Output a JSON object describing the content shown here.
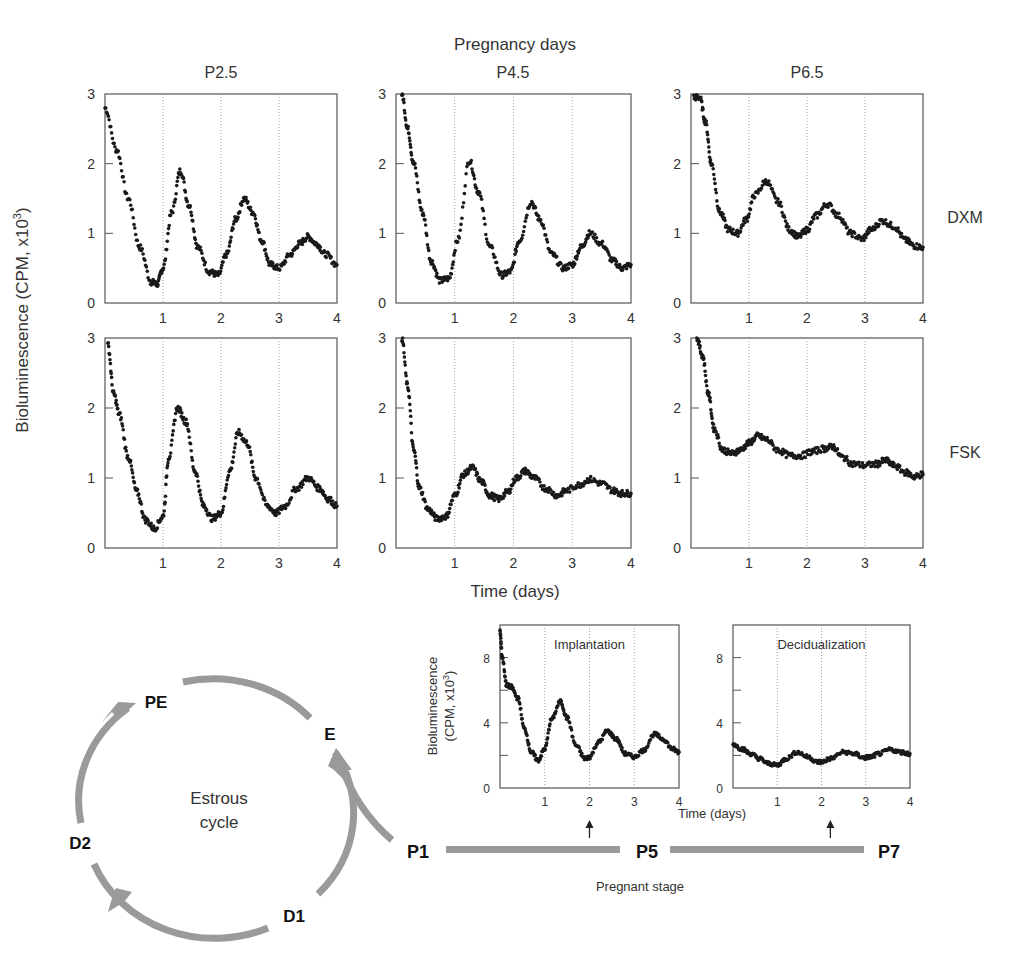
{
  "chart_data": {
    "type": "scatter",
    "title": "Pregnancy days",
    "xlabel": "Time (days)",
    "ylabel": "Bioluminescence (CPM, x10",
    "ylabel_sup": "3",
    "ylabel_close": ")",
    "column_labels": [
      "P2.5",
      "P4.5",
      "P6.5"
    ],
    "row_labels": [
      "DXM",
      "FSK"
    ],
    "xlim": [
      0,
      4
    ],
    "ylim": [
      0,
      3
    ],
    "xticks": [
      "1",
      "2",
      "3",
      "4"
    ],
    "yticks": [
      "0",
      "1",
      "2",
      "3"
    ],
    "grid": "vertical dotted lines at x = 1, 2, 3",
    "panels": [
      {
        "row": "DXM",
        "col": "P2.5",
        "x": [
          0,
          0.2,
          0.4,
          0.6,
          0.8,
          0.9,
          1.0,
          1.15,
          1.3,
          1.45,
          1.6,
          1.8,
          1.95,
          2.1,
          2.25,
          2.4,
          2.55,
          2.7,
          2.85,
          3.0,
          3.2,
          3.35,
          3.5,
          3.65,
          3.8,
          4.0
        ],
        "y": [
          2.8,
          2.2,
          1.5,
          0.8,
          0.3,
          0.27,
          0.5,
          1.3,
          1.9,
          1.4,
          0.8,
          0.45,
          0.4,
          0.7,
          1.2,
          1.5,
          1.3,
          0.9,
          0.55,
          0.5,
          0.7,
          0.85,
          0.95,
          0.85,
          0.7,
          0.55
        ]
      },
      {
        "row": "DXM",
        "col": "P4.5",
        "x": [
          0.1,
          0.2,
          0.3,
          0.45,
          0.6,
          0.75,
          0.9,
          1.05,
          1.25,
          1.4,
          1.6,
          1.8,
          1.95,
          2.1,
          2.3,
          2.45,
          2.65,
          2.85,
          3.0,
          3.15,
          3.3,
          3.5,
          3.7,
          3.85,
          4.0
        ],
        "y": [
          3.0,
          2.5,
          2.0,
          1.3,
          0.6,
          0.32,
          0.35,
          0.9,
          2.05,
          1.6,
          0.8,
          0.4,
          0.45,
          0.9,
          1.45,
          1.2,
          0.7,
          0.5,
          0.55,
          0.8,
          1.0,
          0.85,
          0.6,
          0.5,
          0.55
        ]
      },
      {
        "row": "DXM",
        "col": "P6.5",
        "x": [
          0.05,
          0.15,
          0.25,
          0.35,
          0.5,
          0.65,
          0.8,
          0.95,
          1.1,
          1.3,
          1.5,
          1.7,
          1.85,
          2.0,
          2.15,
          2.35,
          2.55,
          2.75,
          2.95,
          3.1,
          3.3,
          3.5,
          3.7,
          3.85,
          4.0
        ],
        "y": [
          2.95,
          2.95,
          2.6,
          2.0,
          1.3,
          1.05,
          1.0,
          1.2,
          1.55,
          1.75,
          1.45,
          1.05,
          0.95,
          1.05,
          1.25,
          1.42,
          1.25,
          1.0,
          0.92,
          1.05,
          1.18,
          1.1,
          0.9,
          0.82,
          0.8
        ]
      },
      {
        "row": "FSK",
        "col": "P2.5",
        "x": [
          0.05,
          0.15,
          0.25,
          0.4,
          0.55,
          0.7,
          0.85,
          1.0,
          1.1,
          1.25,
          1.4,
          1.55,
          1.7,
          1.85,
          2.0,
          2.15,
          2.3,
          2.45,
          2.6,
          2.8,
          2.95,
          3.1,
          3.3,
          3.5,
          3.7,
          3.85,
          4.0
        ],
        "y": [
          2.9,
          2.2,
          1.9,
          1.3,
          0.8,
          0.4,
          0.28,
          0.45,
          1.3,
          2.0,
          1.8,
          1.1,
          0.6,
          0.42,
          0.5,
          1.1,
          1.65,
          1.5,
          1.0,
          0.6,
          0.5,
          0.6,
          0.85,
          1.0,
          0.85,
          0.7,
          0.6
        ]
      },
      {
        "row": "FSK",
        "col": "P4.5",
        "x": [
          0.1,
          0.2,
          0.3,
          0.4,
          0.55,
          0.7,
          0.85,
          1.0,
          1.15,
          1.3,
          1.45,
          1.6,
          1.75,
          1.9,
          2.05,
          2.2,
          2.35,
          2.55,
          2.75,
          2.9,
          3.1,
          3.3,
          3.5,
          3.7,
          3.85,
          4.0
        ],
        "y": [
          3.0,
          2.3,
          1.4,
          0.85,
          0.55,
          0.42,
          0.45,
          0.75,
          1.05,
          1.15,
          0.95,
          0.75,
          0.7,
          0.8,
          1.0,
          1.1,
          1.0,
          0.85,
          0.75,
          0.82,
          0.9,
          0.98,
          0.92,
          0.82,
          0.78,
          0.78
        ]
      },
      {
        "row": "FSK",
        "col": "P6.5",
        "x": [
          0.1,
          0.2,
          0.3,
          0.4,
          0.55,
          0.7,
          0.85,
          1.0,
          1.15,
          1.3,
          1.5,
          1.7,
          1.9,
          2.1,
          2.3,
          2.45,
          2.6,
          2.8,
          3.0,
          3.2,
          3.35,
          3.5,
          3.7,
          3.85,
          4.0
        ],
        "y": [
          3.0,
          2.75,
          2.2,
          1.7,
          1.4,
          1.35,
          1.4,
          1.5,
          1.6,
          1.55,
          1.4,
          1.32,
          1.32,
          1.38,
          1.42,
          1.45,
          1.3,
          1.2,
          1.18,
          1.2,
          1.25,
          1.18,
          1.08,
          1.02,
          1.05
        ]
      }
    ],
    "inset_plots": [
      {
        "title": "Implantation",
        "ylabel_line1": "Bioluminescence",
        "ylabel_line2": "(CPM, x10",
        "ylabel_sup": "3",
        "ylabel_close": ")",
        "xlim": [
          0,
          4
        ],
        "ylim": [
          0,
          10
        ],
        "xticks": [
          "1",
          "2",
          "3",
          "4"
        ],
        "ytick_values": [
          0,
          2,
          4,
          6,
          8
        ],
        "ytick_labels": [
          "0",
          "4",
          "8"
        ],
        "arrow_at_x": 2,
        "x": [
          0,
          0.05,
          0.15,
          0.25,
          0.4,
          0.55,
          0.7,
          0.85,
          1.0,
          1.15,
          1.35,
          1.5,
          1.7,
          1.9,
          2.0,
          2.2,
          2.4,
          2.6,
          2.8,
          3.0,
          3.2,
          3.45,
          3.65,
          3.85,
          4.0
        ],
        "y": [
          9.6,
          8.0,
          6.3,
          6.2,
          5.5,
          3.6,
          2.2,
          1.7,
          2.4,
          4.2,
          5.3,
          4.3,
          2.6,
          1.8,
          1.9,
          2.8,
          3.5,
          3.0,
          2.1,
          1.9,
          2.3,
          3.3,
          3.0,
          2.4,
          2.2
        ]
      },
      {
        "title": "Decidualization",
        "xlim": [
          0,
          4
        ],
        "ylim": [
          0,
          10
        ],
        "xticks": [
          "1",
          "2",
          "3",
          "4"
        ],
        "ytick_values": [
          0,
          2,
          4,
          6,
          8
        ],
        "ytick_labels": [
          "0",
          "4",
          "8"
        ],
        "arrow_at_x": 2.2,
        "x": [
          0,
          0.2,
          0.4,
          0.6,
          0.8,
          1.0,
          1.2,
          1.45,
          1.7,
          1.9,
          2.0,
          2.2,
          2.5,
          2.75,
          2.95,
          3.1,
          3.3,
          3.55,
          3.8,
          4.0
        ],
        "y": [
          2.7,
          2.4,
          2.1,
          1.8,
          1.5,
          1.4,
          1.8,
          2.2,
          1.9,
          1.6,
          1.6,
          1.8,
          2.2,
          2.1,
          1.85,
          1.9,
          2.1,
          2.35,
          2.2,
          2.1
        ]
      }
    ],
    "inset_xlabel": "Time (days)"
  },
  "cycle": {
    "center_line1": "Estrous",
    "center_line2": "cycle",
    "stages": [
      "PE",
      "E",
      "D1",
      "D2"
    ]
  },
  "timeline": {
    "markers": [
      "P1",
      "P5",
      "P7"
    ],
    "label": "Pregnant stage"
  },
  "colors": {
    "trace": "#1a1a1a",
    "axis": "#555555",
    "grid": "#888888",
    "arrow_gray": "#9a9a9a",
    "text": "#333333"
  }
}
